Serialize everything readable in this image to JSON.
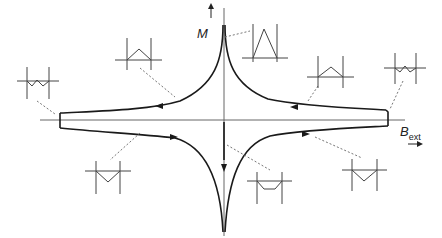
{
  "diagram": {
    "type": "magnetic-hysteresis-loop",
    "axes": {
      "y_label": "M",
      "x_label": "B",
      "x_label_subscript": "ext"
    },
    "insets": [
      {
        "id": "top-peak",
        "shape": "tall-triangle",
        "position": "upper-center"
      },
      {
        "id": "upper-left-inner",
        "shape": "small-hat",
        "position": "upper-left"
      },
      {
        "id": "far-left",
        "shape": "zigzag",
        "position": "far-left"
      },
      {
        "id": "upper-right-inner",
        "shape": "small-hat",
        "position": "upper-right"
      },
      {
        "id": "far-right",
        "shape": "zigzag",
        "position": "far-right"
      },
      {
        "id": "lower-left",
        "shape": "small-v",
        "position": "lower-left"
      },
      {
        "id": "lower-center",
        "shape": "flat-trough",
        "position": "lower-center"
      },
      {
        "id": "lower-right",
        "shape": "small-v",
        "position": "lower-right"
      }
    ],
    "colors": {
      "curve": "#1a1a1a",
      "axis": "#555555",
      "leader": "#777777",
      "inset": "#444444"
    }
  }
}
